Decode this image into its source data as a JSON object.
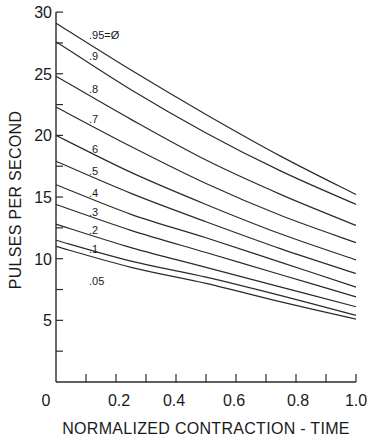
{
  "chart_data": {
    "type": "line",
    "title": "",
    "xlabel": "NORMALIZED CONTRACTION - TIME",
    "ylabel": "PULSES PER SECOND",
    "xlim": [
      0,
      1.0
    ],
    "ylim": [
      0,
      30
    ],
    "grid": false,
    "legend_position": "inline curve labels near left",
    "x_ticks": [
      0,
      0.1,
      0.2,
      0.3,
      0.4,
      0.5,
      0.6,
      0.7,
      0.8,
      0.9,
      1.0
    ],
    "x_tick_labels": [
      {
        "value": 0,
        "label": "0"
      },
      {
        "value": 0.2,
        "label": "0.2"
      },
      {
        "value": 0.4,
        "label": "0.4"
      },
      {
        "value": 0.6,
        "label": "0.6"
      },
      {
        "value": 0.8,
        "label": "0.8"
      },
      {
        "value": 1.0,
        "label": "1.0"
      }
    ],
    "y_ticks": [
      2.5,
      5,
      7.5,
      10,
      12.5,
      15,
      17.5,
      20,
      22.5,
      25,
      27.5,
      30
    ],
    "y_tick_labels": [
      {
        "value": 5,
        "label": "5"
      },
      {
        "value": 10,
        "label": "10"
      },
      {
        "value": 15,
        "label": "15"
      },
      {
        "value": 20,
        "label": "20"
      },
      {
        "value": 25,
        "label": "25"
      },
      {
        "value": 30,
        "label": "30"
      }
    ],
    "x": [
      0,
      0.25,
      0.5,
      0.75,
      1.0
    ],
    "series": [
      {
        "name": ".95=Ø",
        "label_pos": [
          0.11,
          27.8
        ],
        "values": [
          29.1,
          25.3,
          21.7,
          18.3,
          15.2
        ]
      },
      {
        "name": ".9",
        "label_pos": [
          0.11,
          26.1
        ],
        "values": [
          27.6,
          23.7,
          20.2,
          17.1,
          14.4
        ]
      },
      {
        "name": ".8",
        "label_pos": [
          0.11,
          23.4
        ],
        "values": [
          24.8,
          21.3,
          18.0,
          15.2,
          12.7
        ]
      },
      {
        "name": ".7",
        "label_pos": [
          0.11,
          21.0
        ],
        "values": [
          22.3,
          19.1,
          16.1,
          13.5,
          11.3
        ]
      },
      {
        "name": ".6",
        "label_pos": [
          0.11,
          18.6
        ],
        "values": [
          20.0,
          17.0,
          14.4,
          12.0,
          9.9
        ]
      },
      {
        "name": ".5",
        "label_pos": [
          0.11,
          16.8
        ],
        "values": [
          17.9,
          15.3,
          13.0,
          10.8,
          8.8
        ]
      },
      {
        "name": ".4",
        "label_pos": [
          0.11,
          15.0
        ],
        "values": [
          16.0,
          13.6,
          11.7,
          9.7,
          7.7
        ]
      },
      {
        "name": ".3",
        "label_pos": [
          0.11,
          13.5
        ],
        "values": [
          14.4,
          12.3,
          10.5,
          8.7,
          6.9
        ]
      },
      {
        "name": ".2",
        "label_pos": [
          0.11,
          12.0
        ],
        "values": [
          12.8,
          10.9,
          9.3,
          7.7,
          6.1
        ]
      },
      {
        "name": ".1",
        "label_pos": [
          0.11,
          10.5
        ],
        "values": [
          11.5,
          9.8,
          8.5,
          7.0,
          5.4
        ]
      },
      {
        "name": ".05",
        "label_pos": [
          0.11,
          7.9
        ],
        "values": [
          11.0,
          9.3,
          8.0,
          6.5,
          5.1
        ]
      }
    ]
  },
  "layout": {
    "origin_px": [
      56,
      382
    ],
    "x_px_per_unit": 300,
    "y_px_per_unit": 12.33,
    "line_color": "#2a2a2a"
  }
}
